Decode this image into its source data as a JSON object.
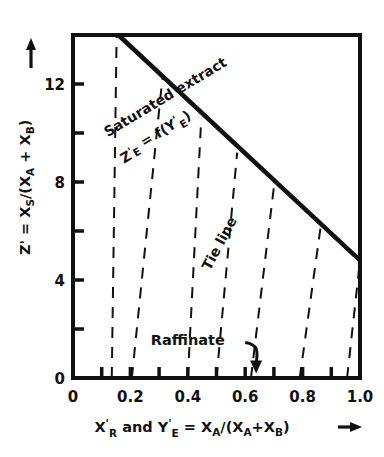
{
  "chart_data": {
    "type": "line",
    "title": "",
    "xlabel": "X'R and Y'E = XA/(XA + XB)",
    "ylabel": "Z' = XS/(XA + XB)",
    "xlim": [
      0,
      1.0
    ],
    "ylim": [
      0,
      14
    ],
    "grid": false,
    "legend": "none",
    "x_ticks": [
      0,
      0.1,
      0.2,
      0.3,
      0.4,
      0.5,
      0.6,
      0.7,
      0.8,
      0.9,
      1.0
    ],
    "x_tick_labels": [
      "0",
      "",
      "0.2",
      "",
      "0.4",
      "",
      "0.6",
      "",
      "0.8",
      "",
      "1.0"
    ],
    "y_ticks": [
      0,
      2,
      4,
      6,
      8,
      10,
      12,
      14
    ],
    "y_tick_labels": [
      "0",
      "",
      "4",
      "",
      "8",
      "",
      "12",
      ""
    ],
    "series": [
      {
        "name": "Saturated extract",
        "style": "solid",
        "linewidth": 4,
        "x": [
          0.158,
          1.0
        ],
        "y": [
          14.0,
          4.8
        ]
      }
    ],
    "tie_lines": {
      "name": "Tie line",
      "style": "dashed",
      "linewidth": 2,
      "lines": [
        {
          "x_bottom": 0.135,
          "y_bottom": 0.0,
          "x_top": 0.152,
          "y_top": 14.0
        },
        {
          "x_bottom": 0.205,
          "y_bottom": 0.0,
          "x_top": 0.312,
          "y_top": 12.3
        },
        {
          "x_bottom": 0.4,
          "y_bottom": 0.0,
          "x_top": 0.447,
          "y_top": 10.6
        },
        {
          "x_bottom": 0.5,
          "y_bottom": 0.0,
          "x_top": 0.572,
          "y_top": 9.2
        },
        {
          "x_bottom": 0.62,
          "y_bottom": 0.0,
          "x_top": 0.7,
          "y_top": 7.8
        },
        {
          "x_bottom": 0.79,
          "y_bottom": 0.0,
          "x_top": 0.862,
          "y_top": 6.1
        },
        {
          "x_bottom": 0.955,
          "y_bottom": 0.0,
          "x_top": 1.0,
          "y_top": 4.8
        }
      ]
    },
    "annotations": [
      {
        "id": "saturated-extract",
        "text": "Saturated extract",
        "rotation": -31,
        "x": 0.33,
        "y": 11.3
      },
      {
        "id": "equilibrium-function",
        "text": "Z'E = f(Y'E)",
        "rotation": -31,
        "x": 0.3,
        "y": 9.6
      },
      {
        "id": "tie-line",
        "text": "Tie line",
        "rotation": -62,
        "x": 0.525,
        "y": 5.4
      },
      {
        "id": "raffinate",
        "text": "Raffinate",
        "rotation": 0,
        "x": 0.4,
        "y": 1.35,
        "arrow": {
          "from_x": 0.6,
          "from_y": 1.45,
          "to_x": 0.638,
          "to_y": 0.18,
          "curved": true
        }
      }
    ]
  },
  "axes": {
    "y_title_main": "Z' = X",
    "y_title_sub1": "S",
    "y_title_mid": "/(X",
    "y_title_sub2": "A",
    "y_title_plus": " + X",
    "y_title_sub3": "B",
    "y_title_close": ")",
    "y_arrow": "arrow-up-icon",
    "x_title_x": "X",
    "x_title_x_prime": "'",
    "x_title_x_sub": "R",
    "x_title_and": "and",
    "x_title_y": "Y",
    "x_title_y_prime": "'",
    "x_title_y_sub": "E",
    "x_title_eq": "= X",
    "x_title_a1": "A",
    "x_title_div": "/(X",
    "x_title_a2": "A",
    "x_title_plus": "+X",
    "x_title_b": "B",
    "x_title_close": ")",
    "x_arrow": "arrow-right-icon"
  },
  "style": {
    "ink": "#111111",
    "background": "#ffffff",
    "frame_width": 4,
    "curve_width": 4.5,
    "dash_width": 2.2
  }
}
